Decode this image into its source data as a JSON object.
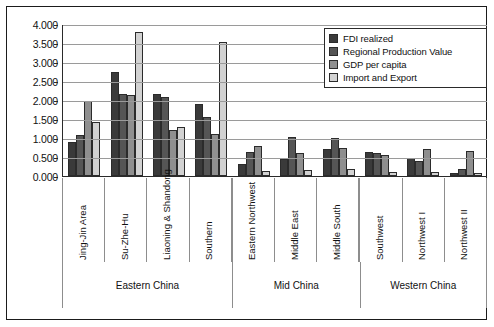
{
  "chart_data": {
    "type": "bar",
    "title": "",
    "xlabel": "",
    "ylabel": "",
    "ylim": [
      0,
      4.0
    ],
    "ytick_step": 0.5,
    "yticks": [
      "0.000",
      "0.500",
      "1.000",
      "1.500",
      "2.000",
      "2.500",
      "3.000",
      "3.500",
      "4.000"
    ],
    "grid": true,
    "legend_position": "top-right",
    "categories": [
      "Jing-Jin Area",
      "Su-Zhe-Hu",
      "Liaoning & Shandong",
      "Southern",
      "Eastern Northwest",
      "Middle East",
      "Middle South",
      "Southwest",
      "Northwest I",
      "Northwest II"
    ],
    "region_groups": [
      {
        "label": "Eastern China",
        "span": 4
      },
      {
        "label": "Mid China",
        "span": 3
      },
      {
        "label": "Western China",
        "span": 3
      }
    ],
    "series": [
      {
        "name": "FDI realized",
        "color": "#3a3a3a",
        "values": [
          0.9,
          2.75,
          2.17,
          1.9,
          0.31,
          0.45,
          0.7,
          0.62,
          0.48,
          0.07
        ]
      },
      {
        "name": "Regional Production Value",
        "color": "#555555",
        "values": [
          1.07,
          2.15,
          2.08,
          1.55,
          0.62,
          1.02,
          1.0,
          0.6,
          0.4,
          0.18
        ]
      },
      {
        "name": "GDP per capita",
        "color": "#8f8f8f",
        "values": [
          1.97,
          2.13,
          1.21,
          1.1,
          0.79,
          0.6,
          0.73,
          0.56,
          0.72,
          0.65
        ]
      },
      {
        "name": "Import and Export",
        "color": "#d2d2d2",
        "values": [
          1.42,
          3.78,
          1.28,
          3.52,
          0.14,
          0.15,
          0.18,
          0.1,
          0.1,
          0.07
        ]
      }
    ]
  }
}
